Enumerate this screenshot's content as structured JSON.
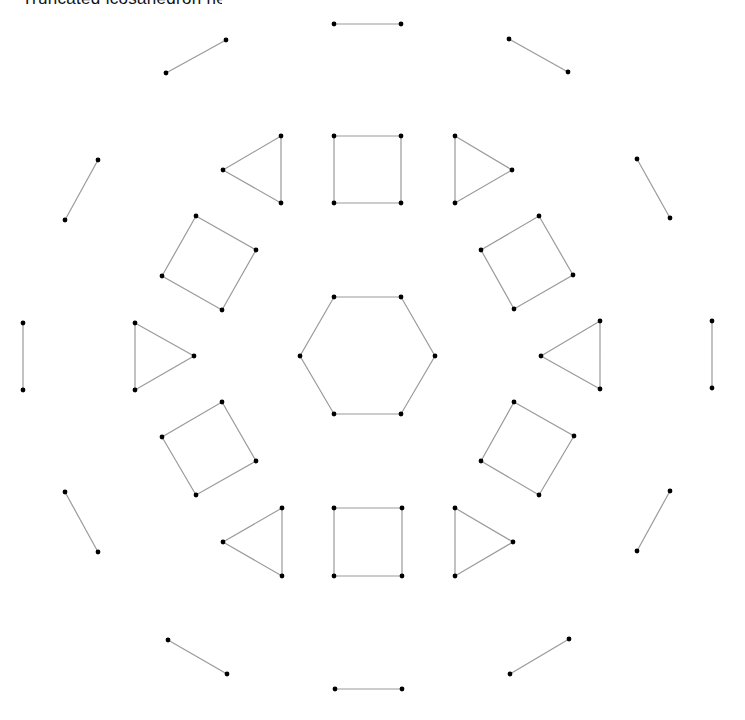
{
  "title": "Truncated icosahedron net",
  "style": {
    "edge_color": "#9a9a9a",
    "vertex_color": "#000000",
    "background": "#ffffff"
  },
  "shapes": [
    {
      "name": "center-hexagon",
      "points": [
        [
          334,
          297
        ],
        [
          401,
          297
        ],
        [
          435,
          356
        ],
        [
          401,
          414
        ],
        [
          334,
          414
        ],
        [
          300,
          356
        ]
      ]
    },
    {
      "name": "square-top",
      "points": [
        [
          334,
          136
        ],
        [
          401,
          136
        ],
        [
          401,
          203
        ],
        [
          334,
          203
        ]
      ]
    },
    {
      "name": "square-bottom",
      "points": [
        [
          334,
          508
        ],
        [
          402,
          508
        ],
        [
          402,
          576
        ],
        [
          334,
          576
        ]
      ]
    },
    {
      "name": "square-upper-left",
      "points": [
        [
          196,
          216
        ],
        [
          256,
          250
        ],
        [
          222,
          310
        ],
        [
          162,
          276
        ]
      ]
    },
    {
      "name": "square-lower-left",
      "points": [
        [
          222,
          402
        ],
        [
          256,
          461
        ],
        [
          196,
          495
        ],
        [
          162,
          437
        ]
      ]
    },
    {
      "name": "square-upper-right",
      "points": [
        [
          539,
          216
        ],
        [
          573,
          275
        ],
        [
          514,
          309
        ],
        [
          481,
          250
        ]
      ]
    },
    {
      "name": "square-lower-right",
      "points": [
        [
          514,
          402
        ],
        [
          574,
          436
        ],
        [
          539,
          495
        ],
        [
          481,
          461
        ]
      ]
    },
    {
      "name": "triangle-top-left",
      "points": [
        [
          223,
          170
        ],
        [
          281,
          136
        ],
        [
          281,
          203
        ]
      ]
    },
    {
      "name": "triangle-top-right",
      "points": [
        [
          455,
          136
        ],
        [
          512,
          170
        ],
        [
          455,
          203
        ]
      ]
    },
    {
      "name": "triangle-left",
      "points": [
        [
          135,
          323
        ],
        [
          194,
          356
        ],
        [
          135,
          390
        ]
      ]
    },
    {
      "name": "triangle-right",
      "points": [
        [
          541,
          356
        ],
        [
          600,
          321
        ],
        [
          600,
          389
        ]
      ]
    },
    {
      "name": "triangle-bottom-left",
      "points": [
        [
          223,
          542
        ],
        [
          282,
          508
        ],
        [
          282,
          576
        ]
      ]
    },
    {
      "name": "triangle-bottom-right",
      "points": [
        [
          455,
          508
        ],
        [
          513,
          542
        ],
        [
          455,
          576
        ]
      ]
    }
  ],
  "segments": [
    {
      "name": "segment-top",
      "points": [
        [
          334,
          24
        ],
        [
          401,
          24
        ]
      ]
    },
    {
      "name": "segment-top-left",
      "points": [
        [
          166,
          73
        ],
        [
          226,
          40
        ]
      ]
    },
    {
      "name": "segment-top-right",
      "points": [
        [
          509,
          39
        ],
        [
          568,
          72
        ]
      ]
    },
    {
      "name": "segment-upper-left",
      "points": [
        [
          65,
          220
        ],
        [
          98,
          160
        ]
      ]
    },
    {
      "name": "segment-upper-right",
      "points": [
        [
          637,
          159
        ],
        [
          670,
          218
        ]
      ]
    },
    {
      "name": "segment-left",
      "points": [
        [
          23,
          323
        ],
        [
          23,
          390
        ]
      ]
    },
    {
      "name": "segment-right",
      "points": [
        [
          712,
          321
        ],
        [
          712,
          388
        ]
      ]
    },
    {
      "name": "segment-lower-left",
      "points": [
        [
          65,
          492
        ],
        [
          98,
          552
        ]
      ]
    },
    {
      "name": "segment-lower-right",
      "points": [
        [
          670,
          491
        ],
        [
          637,
          551
        ]
      ]
    },
    {
      "name": "segment-bottom-left",
      "points": [
        [
          168,
          640
        ],
        [
          227,
          674
        ]
      ]
    },
    {
      "name": "segment-bottom-right",
      "points": [
        [
          510,
          674
        ],
        [
          569,
          639
        ]
      ]
    },
    {
      "name": "segment-bottom",
      "points": [
        [
          335,
          689
        ],
        [
          402,
          689
        ]
      ]
    }
  ]
}
